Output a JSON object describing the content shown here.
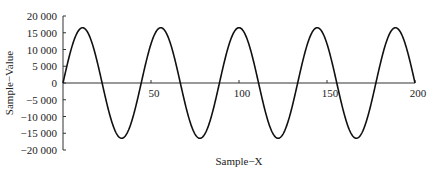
{
  "chart_data": {
    "type": "line",
    "title": "",
    "xlabel": "Sample−X",
    "ylabel": "Sample−Value",
    "xlim": [
      0,
      200
    ],
    "ylim": [
      -20000,
      20000
    ],
    "x_ticks": [
      50,
      100,
      150,
      200
    ],
    "x_tick_labels": [
      "50",
      "100",
      "150",
      "200"
    ],
    "y_ticks": [
      20000,
      15000,
      10000,
      5000,
      0,
      -5000,
      -10000,
      -15000,
      -20000
    ],
    "y_tick_labels": [
      "20 000",
      "15 000",
      "10 000",
      "5 000",
      "0",
      "−5 000",
      "−10 000",
      "−15 000",
      "−20 000"
    ],
    "grid": false,
    "legend": "none",
    "series": [
      {
        "name": "sine",
        "function": "sin",
        "amplitude": 16500,
        "cycles": 4.5,
        "x_start": 0,
        "x_end": 200,
        "color": "#111111"
      }
    ]
  }
}
